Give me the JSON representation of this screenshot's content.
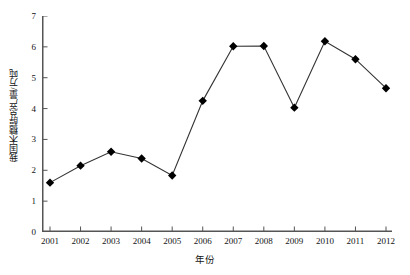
{
  "chart_data": {
    "type": "line",
    "title": "",
    "xlabel": "年份",
    "ylabel": "我国木糖醇总产量/万吨",
    "categories": [
      "2001",
      "2002",
      "2003",
      "2004",
      "2005",
      "2006",
      "2007",
      "2008",
      "2009",
      "2010",
      "2011",
      "2012"
    ],
    "values": [
      1.6,
      2.15,
      2.6,
      2.38,
      1.83,
      4.25,
      6.02,
      6.03,
      4.03,
      6.18,
      5.6,
      4.66
    ],
    "series": [
      {
        "name": "我国木糖醇总产量",
        "values": [
          1.6,
          2.15,
          2.6,
          2.38,
          1.83,
          4.25,
          6.02,
          6.03,
          4.03,
          6.18,
          5.6,
          4.66
        ]
      }
    ],
    "ylim": [
      0,
      7
    ],
    "yticks": [
      "0",
      "1",
      "2",
      "3",
      "4",
      "5",
      "6",
      "7"
    ],
    "xticks": [
      "2001",
      "2002",
      "2003",
      "2004",
      "2005",
      "2006",
      "2007",
      "2008",
      "2009",
      "2010",
      "2011",
      "2012"
    ],
    "grid": false,
    "legend": "none",
    "marker": "diamond",
    "line_color": "#333333",
    "marker_color": "#000000",
    "axis_color": "#555555"
  },
  "axes": {
    "y_title": "我国木糖醇总产量/万吨",
    "x_title": "年份"
  }
}
